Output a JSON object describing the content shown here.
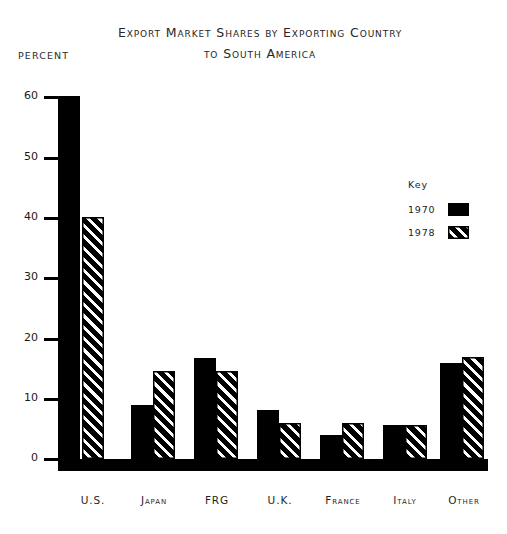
{
  "chart_data": {
    "type": "bar",
    "title": "Export Market Shares by Exporting Country to South America",
    "title_lines": [
      "Export Market Shares by Exporting Country",
      "to South America"
    ],
    "ylabel": "PERCENT",
    "xlabel": "",
    "ylim": [
      0,
      60
    ],
    "yticks": [
      0,
      10,
      20,
      30,
      40,
      50,
      60
    ],
    "ytick_labels": [
      "0",
      "10",
      "20",
      "30",
      "40",
      "50",
      "60"
    ],
    "grid": false,
    "legend_position": "upper-right-inside",
    "legend_title": "Key",
    "categories": [
      "U.S.",
      "Japan",
      "FRG",
      "U.K.",
      "France",
      "Italy",
      "Other"
    ],
    "series": [
      {
        "name": "1970",
        "fill": "solid-black",
        "values": [
          60.0,
          9.0,
          16.7,
          8.1,
          4.0,
          5.7,
          15.8
        ]
      },
      {
        "name": "1978",
        "fill": "diagonal-hatch",
        "values": [
          40.0,
          14.5,
          14.5,
          6.0,
          6.0,
          5.7,
          16.8
        ]
      }
    ]
  },
  "colors": {
    "ink": "#000000",
    "background": "#ffffff",
    "text": "#1a1a1a"
  }
}
